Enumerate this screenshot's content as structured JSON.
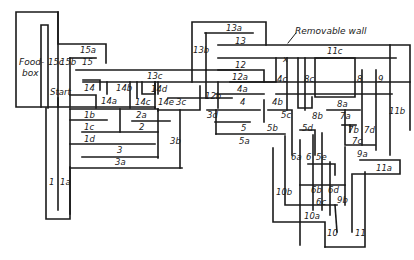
{
  "diagram": {
    "type": "maze",
    "annotations": {
      "foodbox_1": "Food-",
      "foodbox_2": "box",
      "start": "Start",
      "removable_wall": "Removable wall",
      "removable_marker": "x"
    },
    "cells": {
      "c1": "1",
      "c1a": "1a",
      "c1b": "1b",
      "c1c": "1c",
      "c1d": "1d",
      "c2": "2",
      "c2a": "2a",
      "c3": "3",
      "c3a": "3a",
      "c3b": "3b",
      "c3c": "3c",
      "c3d": "3d",
      "c4": "4",
      "c4a": "4a",
      "c4b": "4b",
      "c4c": "4c",
      "c5": "5",
      "c5a": "5a",
      "c5b": "5b",
      "c5c": "5c",
      "c5d": "5d",
      "c5e": "5e",
      "c6": "6",
      "c6a": "6a",
      "c6b": "6b",
      "c6c": "6c",
      "c6d": "6d",
      "c7a": "7a",
      "c7b": "7b",
      "c7c": "7c",
      "c7d": "7d",
      "c8": "8",
      "c8a": "8a",
      "c8b": "8b",
      "c8c": "8c",
      "c9": "9",
      "c9a": "9a",
      "c9b": "9b",
      "c10": "10",
      "c10a": "10a",
      "c10b": "10b",
      "c11": "11",
      "c11a": "11a",
      "c11b": "11b",
      "c11c": "11c",
      "c12": "12",
      "c12a": "12a",
      "c12b": "12b",
      "c13": "13",
      "c13a": "13a",
      "c13b": "13b",
      "c13c": "13c",
      "c14": "14",
      "c14a": "14a",
      "c14b": "14b",
      "c14c": "14c",
      "c14d": "14d",
      "c14e": "14e",
      "c15": "15",
      "c15a": "15a",
      "c15b": "15b",
      "c15c": "15c"
    }
  }
}
